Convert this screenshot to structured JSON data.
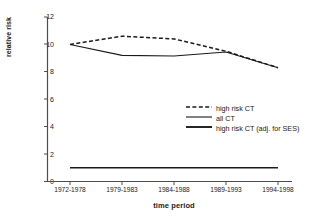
{
  "chart_data": {
    "type": "line",
    "title": "",
    "xlabel": "time period",
    "ylabel": "relative risk",
    "categories": [
      "1972-1978",
      "1979-1983",
      "1984-1988",
      "1989-1993",
      "1994-1998"
    ],
    "ylim": [
      0,
      12
    ],
    "yticks": [
      0,
      2,
      4,
      6,
      8,
      10,
      12
    ],
    "grid": false,
    "legend_position": "center-right",
    "series": [
      {
        "name": "high risk CT",
        "style": "dashed",
        "values": [
          10.0,
          10.6,
          10.4,
          9.5,
          8.3
        ]
      },
      {
        "name": "all CT",
        "style": "solid-thin",
        "values": [
          10.0,
          9.2,
          9.15,
          9.45,
          8.3
        ]
      },
      {
        "name": "high risk CT (adj. for SES)",
        "style": "solid-thick",
        "values": [
          1.0,
          1.0,
          1.0,
          1.0,
          1.0
        ]
      }
    ]
  },
  "axis": {
    "y_tick_labels": [
      "0",
      "2",
      "4",
      "6",
      "8",
      "10",
      "12"
    ],
    "y_title": "relative risk",
    "x_tick_labels": [
      "1972-1978",
      "1979-1983",
      "1984-1988",
      "1989-1993",
      "1994-1998"
    ],
    "x_title": "time period"
  },
  "legend": {
    "items": [
      {
        "label": "high risk CT"
      },
      {
        "label": "all CT"
      },
      {
        "label": "high risk CT (adj. for SES)"
      }
    ]
  },
  "colors": {
    "line": "#1a1a1a",
    "axis": "#4d4d4d",
    "background": "#ffffff"
  }
}
